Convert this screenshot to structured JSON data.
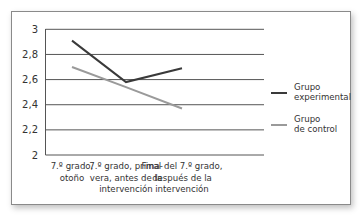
{
  "chart_data": {
    "type": "line",
    "title": "",
    "xlabel": "",
    "ylabel": "",
    "ylim": [
      2,
      3
    ],
    "yticks": [
      "2",
      "2,2",
      "2,4",
      "2,6",
      "2,8",
      "3"
    ],
    "grid": true,
    "legend_position": "right",
    "categories": [
      [
        "7.º grado,",
        "otoño"
      ],
      [
        "7.º grado, prima-",
        "vera, antes de la",
        "intervención"
      ],
      [
        "Final del 7.º grado,",
        "después de la",
        "intervención"
      ]
    ],
    "series": [
      {
        "name": "Grupo experimental",
        "label_lines": [
          "Grupo",
          "experimental"
        ],
        "color": "#3a3a3a",
        "values": [
          2.91,
          2.58,
          2.69
        ]
      },
      {
        "name": "Grupo de control",
        "label_lines": [
          "Grupo",
          "de control"
        ],
        "color": "#9a9a9a",
        "values": [
          2.7,
          2.54,
          2.37
        ]
      }
    ]
  }
}
